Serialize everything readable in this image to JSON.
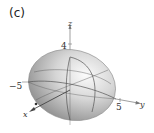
{
  "panel": {
    "label": "(c)"
  },
  "figure": {
    "type": "3d-surface",
    "surface": "ellipsoid",
    "axes": {
      "x": {
        "label": "x"
      },
      "y": {
        "label": "y"
      },
      "z": {
        "label": "z"
      }
    },
    "ticks": {
      "z_pos": "4",
      "y_neg": "−5",
      "y_pos": "5"
    },
    "colors": {
      "surface_light": "#f4f4f4",
      "surface_dark": "#8c8c8c",
      "grid_line": "#555555",
      "axis": "#666666"
    }
  }
}
